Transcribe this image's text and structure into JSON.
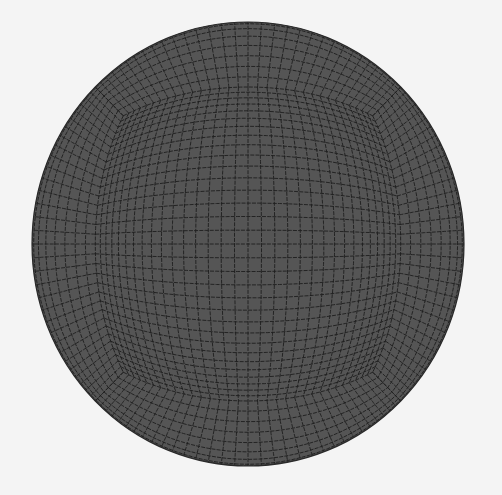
{
  "figure": {
    "background_color": "#f4f4f4",
    "fill_color": "#555555",
    "line_color": "#1e1e1e",
    "center": [
      248,
      244
    ],
    "radii": [
      216,
      222
    ],
    "grid_divisions": 32
  }
}
